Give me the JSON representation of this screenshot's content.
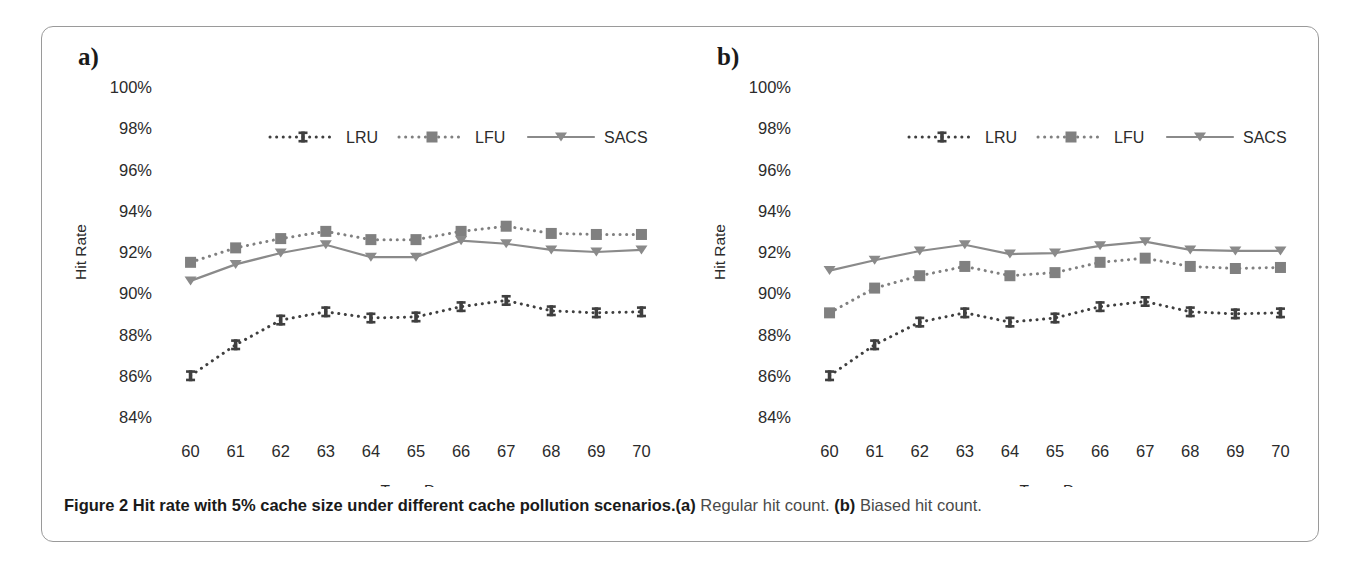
{
  "figure": {
    "caption_bold": "Figure 2 Hit rate with 5% cache size under different cache pollution scenarios.",
    "caption_a_tag": "(a)",
    "caption_a_text": " Regular hit count. ",
    "caption_b_tag": "(b)",
    "caption_b_text": " Biased hit count."
  },
  "panels": [
    {
      "letter": "a)",
      "name": "panel-a"
    },
    {
      "letter": "b)",
      "name": "panel-b"
    }
  ],
  "colors": {
    "lru": "#3f3f3f",
    "lfu": "#808080",
    "sacs": "#8a8a8a",
    "axis": "#2b2b2b",
    "frame": "#9a9a9a"
  },
  "chart_data": [
    {
      "type": "line",
      "title": "a) Regular hit count",
      "xlabel": "Trace Day",
      "ylabel": "Hit Rate",
      "x": [
        60,
        61,
        62,
        63,
        64,
        65,
        66,
        67,
        68,
        69,
        70
      ],
      "xticklabels": [
        "60",
        "61",
        "62",
        "63",
        "64",
        "65",
        "66",
        "67",
        "68",
        "69",
        "70"
      ],
      "yticklabels": [
        "84%",
        "86%",
        "88%",
        "90%",
        "92%",
        "94%",
        "96%",
        "98%",
        "100%"
      ],
      "yticks": [
        84,
        86,
        88,
        90,
        92,
        94,
        96,
        98,
        100
      ],
      "ylim": [
        84,
        100
      ],
      "xlim": [
        59.5,
        70.5
      ],
      "grid": false,
      "legend_position": "top-center",
      "series": [
        {
          "name": "LRU",
          "marker": "ibeam",
          "linestyle": "dotted",
          "color": "#3f3f3f",
          "values": [
            86.0,
            87.5,
            88.7,
            89.1,
            88.8,
            88.85,
            89.35,
            89.65,
            89.15,
            89.05,
            89.1
          ]
        },
        {
          "name": "LFU",
          "marker": "square",
          "linestyle": "dotted",
          "color": "#808080",
          "values": [
            91.5,
            92.2,
            92.65,
            93.0,
            92.6,
            92.6,
            93.0,
            93.25,
            92.9,
            92.85,
            92.85
          ]
        },
        {
          "name": "SACS",
          "marker": "triangle-down",
          "linestyle": "solid",
          "color": "#8a8a8a",
          "values": [
            90.6,
            91.4,
            91.95,
            92.35,
            91.75,
            91.75,
            92.55,
            92.4,
            92.1,
            92.0,
            92.1
          ]
        }
      ]
    },
    {
      "type": "line",
      "title": "b) Biased hit count",
      "xlabel": "Trace Day",
      "ylabel": "Hit Rate",
      "x": [
        60,
        61,
        62,
        63,
        64,
        65,
        66,
        67,
        68,
        69,
        70
      ],
      "xticklabels": [
        "60",
        "61",
        "62",
        "63",
        "64",
        "65",
        "66",
        "67",
        "68",
        "69",
        "70"
      ],
      "yticklabels": [
        "84%",
        "86%",
        "88%",
        "90%",
        "92%",
        "94%",
        "96%",
        "98%",
        "100%"
      ],
      "yticks": [
        84,
        86,
        88,
        90,
        92,
        94,
        96,
        98,
        100
      ],
      "ylim": [
        84,
        100
      ],
      "xlim": [
        59.5,
        70.5
      ],
      "grid": false,
      "legend_position": "top-center",
      "series": [
        {
          "name": "LRU",
          "marker": "ibeam",
          "linestyle": "dotted",
          "color": "#3f3f3f",
          "values": [
            86.0,
            87.5,
            88.6,
            89.05,
            88.6,
            88.8,
            89.35,
            89.6,
            89.1,
            89.0,
            89.05
          ]
        },
        {
          "name": "LFU",
          "marker": "square",
          "linestyle": "dotted",
          "color": "#808080",
          "values": [
            89.05,
            90.25,
            90.85,
            91.3,
            90.85,
            91.0,
            91.5,
            91.7,
            91.3,
            91.2,
            91.25
          ]
        },
        {
          "name": "SACS",
          "marker": "triangle-down",
          "linestyle": "solid",
          "color": "#8a8a8a",
          "values": [
            91.1,
            91.6,
            92.05,
            92.35,
            91.9,
            91.95,
            92.3,
            92.5,
            92.1,
            92.05,
            92.05
          ]
        }
      ]
    }
  ]
}
